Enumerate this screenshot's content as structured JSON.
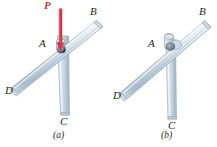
{
  "figure": {
    "background_color": "#ffffff",
    "bar_fill_light": "#e8eef3",
    "bar_fill_mid": "#c3d2de",
    "bar_fill_dark": "#9fb3c4",
    "bar_stroke": "#8ba0b2",
    "pin_color": "#7b8a96",
    "force_color": "#d9434e",
    "label_color": "#231f20"
  },
  "panels": [
    {
      "id": "a",
      "caption": "(a)",
      "has_force": true,
      "force": {
        "label": "P",
        "direction": "down",
        "applied_at": "A"
      },
      "labels": {
        "A": "A",
        "B": "B",
        "C": "C",
        "D": "D"
      }
    },
    {
      "id": "b",
      "caption": "(b)",
      "has_force": false,
      "labels": {
        "A": "A",
        "B": "B",
        "C": "C",
        "D": "D"
      }
    }
  ]
}
